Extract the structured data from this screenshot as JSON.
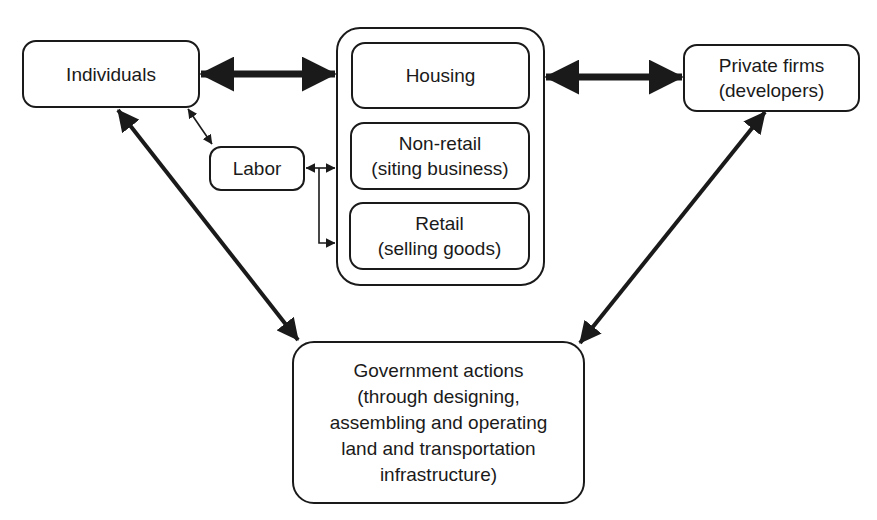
{
  "diagram": {
    "nodes": {
      "individuals": {
        "lines": [
          "Individuals"
        ]
      },
      "housing": {
        "lines": [
          "Housing"
        ]
      },
      "nonretail": {
        "lines": [
          "Non-retail",
          "(siting business)"
        ]
      },
      "retail": {
        "lines": [
          "Retail",
          "(selling goods)"
        ]
      },
      "labor": {
        "lines": [
          "Labor"
        ]
      },
      "private_firms": {
        "lines": [
          "Private firms",
          "(developers)"
        ]
      },
      "government": {
        "lines": [
          "Government actions",
          "(through designing,",
          "assembling and operating",
          "land and transportation",
          "infrastructure)"
        ]
      }
    },
    "edges": [
      {
        "from": "individuals",
        "to": "land-use-group",
        "type": "bidirectional",
        "weight": "heavy"
      },
      {
        "from": "land-use-group",
        "to": "private_firms",
        "type": "bidirectional",
        "weight": "heavy"
      },
      {
        "from": "individuals",
        "to": "labor",
        "type": "bidirectional",
        "weight": "light"
      },
      {
        "from": "labor",
        "to": "nonretail",
        "type": "bidirectional",
        "weight": "light"
      },
      {
        "from": "labor",
        "to": "retail",
        "type": "unidirectional",
        "weight": "light"
      },
      {
        "from": "individuals",
        "to": "government",
        "type": "bidirectional",
        "weight": "medium"
      },
      {
        "from": "private_firms",
        "to": "government",
        "type": "bidirectional",
        "weight": "medium"
      }
    ],
    "colors": {
      "stroke": "#1a1a1a",
      "background": "#ffffff"
    }
  }
}
